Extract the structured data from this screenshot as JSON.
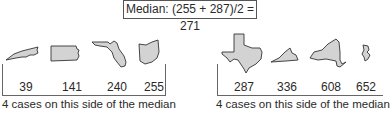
{
  "median_label": "Median: (255 + 287)/2 = 271",
  "left_group": {
    "states": [
      {
        "name": "North Carolina",
        "value": "39"
      },
      {
        "name": "Pennsylvania",
        "value": "141"
      },
      {
        "name": "Florida",
        "value": "240"
      },
      {
        "name": "Ohio",
        "value": "255"
      }
    ],
    "caption": "4 cases on this side of the median"
  },
  "right_group": {
    "states": [
      {
        "name": "Texas",
        "value": "287"
      },
      {
        "name": "Virginia",
        "value": "336"
      },
      {
        "name": "New York",
        "value": "608"
      },
      {
        "name": "New Jersey",
        "value": "652"
      }
    ],
    "caption": "4 cases on this side of the median"
  }
}
